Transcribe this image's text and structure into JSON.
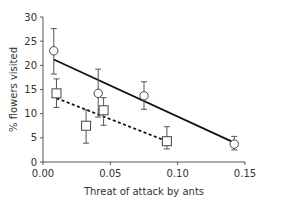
{
  "chart_data": {
    "type": "scatter",
    "title": "",
    "xlabel": "Threat of attack by ants",
    "ylabel": "% flowers visited",
    "xlim": [
      0,
      0.15
    ],
    "ylim": [
      0,
      30
    ],
    "x_ticks": [
      "0.00",
      "0.05",
      "0.10",
      "0.15"
    ],
    "y_ticks": [
      "0",
      "5",
      "10",
      "15",
      "20",
      "25",
      "30"
    ],
    "grid": false,
    "legend": null,
    "series": [
      {
        "name": "circles",
        "marker": "circle",
        "line_style": "solid",
        "points": [
          {
            "x": 0.008,
            "y": 23.0,
            "err_low": 18.2,
            "err_high": 27.6
          },
          {
            "x": 0.041,
            "y": 14.2,
            "err_low": 9.3,
            "err_high": 19.2
          },
          {
            "x": 0.075,
            "y": 13.7,
            "err_low": 10.9,
            "err_high": 16.6
          },
          {
            "x": 0.142,
            "y": 3.7,
            "err_low": 2.5,
            "err_high": 5.3
          }
        ],
        "fit_line": {
          "x0": 0.008,
          "y0": 21.2,
          "x1": 0.142,
          "y1": 4.0
        }
      },
      {
        "name": "squares",
        "marker": "square",
        "line_style": "dashed",
        "points": [
          {
            "x": 0.01,
            "y": 14.2,
            "err_low": 11.3,
            "err_high": 17.2
          },
          {
            "x": 0.032,
            "y": 7.5,
            "err_low": 3.9,
            "err_high": 10.8
          },
          {
            "x": 0.045,
            "y": 10.7,
            "err_low": 7.6,
            "err_high": 13.3
          },
          {
            "x": 0.092,
            "y": 4.3,
            "err_low": 2.7,
            "err_high": 7.3
          }
        ],
        "fit_line": {
          "x0": 0.01,
          "y0": 13.2,
          "x1": 0.092,
          "y1": 4.3
        }
      }
    ]
  }
}
